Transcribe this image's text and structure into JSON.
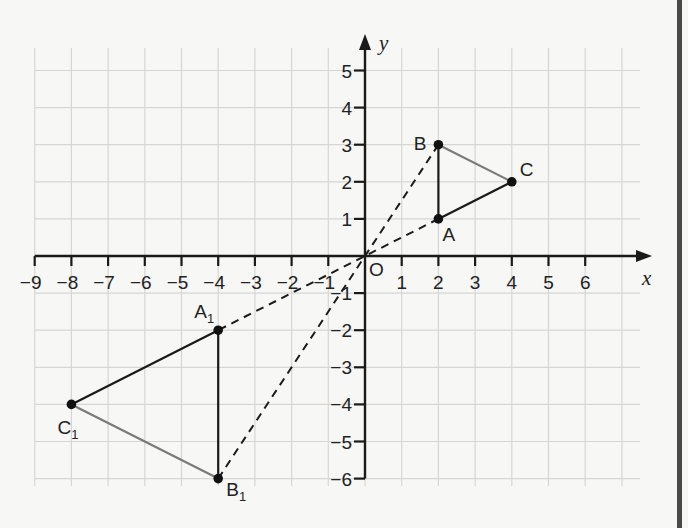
{
  "diagram": {
    "type": "coordinate-plane-transformation",
    "axes": {
      "x_label": "x",
      "y_label": "y",
      "origin_label": "O",
      "x_ticks": [
        -9,
        -8,
        -7,
        -6,
        -5,
        -4,
        -3,
        -2,
        -1,
        1,
        2,
        3,
        4,
        5,
        6
      ],
      "y_ticks": [
        5,
        4,
        3,
        2,
        1,
        -1,
        -2,
        -3,
        -4,
        -5,
        -6
      ],
      "x_range": [
        -9,
        7
      ],
      "y_range": [
        -6,
        5
      ]
    },
    "grid": {
      "on": true,
      "color": "#d6d6d6"
    },
    "colors": {
      "axis": "#1a1a1a",
      "edge_dark": "#1a1a1a",
      "edge_gray": "#7a7a7a",
      "point": "#111111",
      "background": "#f7f7f6"
    },
    "triangles": [
      {
        "name": "ABC",
        "points": [
          {
            "label": "A",
            "x": 2,
            "y": 1
          },
          {
            "label": "B",
            "x": 2,
            "y": 3
          },
          {
            "label": "C",
            "x": 4,
            "y": 2
          }
        ],
        "edges": [
          {
            "from": "A",
            "to": "B",
            "style": "dark"
          },
          {
            "from": "A",
            "to": "C",
            "style": "dark"
          },
          {
            "from": "B",
            "to": "C",
            "style": "gray"
          }
        ]
      },
      {
        "name": "A1B1C1",
        "points": [
          {
            "label": "A",
            "sub": "1",
            "x": -4,
            "y": -2
          },
          {
            "label": "B",
            "sub": "1",
            "x": -4,
            "y": -6
          },
          {
            "label": "C",
            "sub": "1",
            "x": -8,
            "y": -4
          }
        ],
        "edges": [
          {
            "from": "A1",
            "to": "B1",
            "style": "dark"
          },
          {
            "from": "A1",
            "to": "C1",
            "style": "dark"
          },
          {
            "from": "B1",
            "to": "C1",
            "style": "gray"
          }
        ]
      }
    ],
    "dashed_rays": [
      {
        "from": "A",
        "to": "A1",
        "through": "O"
      },
      {
        "from": "B",
        "to": "B1",
        "through": "O"
      }
    ]
  }
}
